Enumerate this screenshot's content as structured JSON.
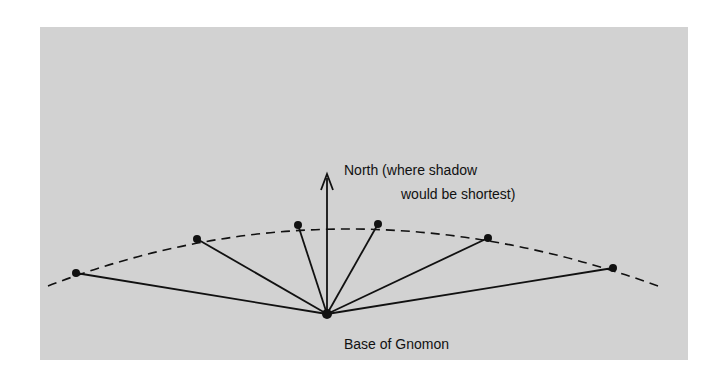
{
  "figure": {
    "north_label_line1": "North (where shadow",
    "north_label_line2": "would be shortest)",
    "base_label": "Base of Gnomon",
    "colors": {
      "background": "#d2d2d2",
      "ink": "#111111"
    }
  },
  "geometry": {
    "base": [
      327,
      314
    ],
    "arrow_tip": [
      327,
      175
    ],
    "shadow_tips": [
      [
        76,
        273
      ],
      [
        197,
        239
      ],
      [
        298,
        225
      ],
      [
        378,
        224
      ],
      [
        488,
        238
      ],
      [
        613,
        268
      ]
    ]
  }
}
